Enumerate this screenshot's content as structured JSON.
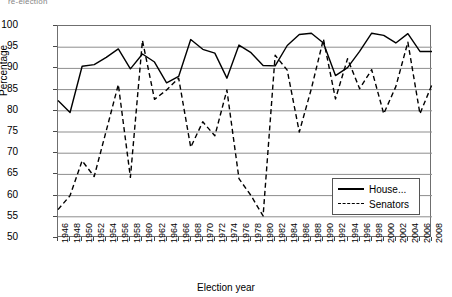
{
  "caption_fragment": "re-election",
  "axis": {
    "ylabel": "Percentage",
    "xlabel": "Election year",
    "y_ticks": [
      100,
      95,
      90,
      85,
      80,
      75,
      70,
      65,
      60,
      55,
      50
    ]
  },
  "legend": {
    "position": "inside-bottom-right",
    "entries": [
      {
        "label": "House...",
        "style": "solid"
      },
      {
        "label": "Senators",
        "style": "dashed"
      }
    ]
  },
  "chart_data": {
    "type": "line",
    "title": "",
    "subtitle": "",
    "xlabel": "Election year",
    "ylabel": "Percentage",
    "xlim": [
      1946,
      2008
    ],
    "ylim": [
      50,
      100
    ],
    "grid": true,
    "legend_position": "inside-bottom-right",
    "annotations": [],
    "x": [
      1946,
      1948,
      1950,
      1952,
      1954,
      1956,
      1958,
      1960,
      1962,
      1964,
      1966,
      1968,
      1970,
      1972,
      1974,
      1976,
      1978,
      1980,
      1982,
      1984,
      1986,
      1988,
      1990,
      1992,
      1994,
      1996,
      1998,
      2000,
      2002,
      2004,
      2006,
      2008
    ],
    "tick_labels": [
      "1946",
      "1948",
      "1950",
      "1952",
      "1954",
      "1956",
      "1958",
      "1960",
      "1962",
      "1964",
      "1966",
      "1968",
      "1970",
      "1972",
      "1974",
      "1976",
      "1978",
      "1980",
      "1982",
      "1984",
      "1986",
      "1988",
      "1990",
      "1992",
      "1994",
      "1996",
      "1998",
      "2000",
      "2002",
      "2004",
      "2006",
      "2008"
    ],
    "series": [
      {
        "name": "House...",
        "style": "solid",
        "color": "#000000",
        "values": [
          82.4,
          79.6,
          90.5,
          90.9,
          92.6,
          94.6,
          89.9,
          93.4,
          91.5,
          86.6,
          88.1,
          96.8,
          94.5,
          93.6,
          87.7,
          95.5,
          93.7,
          90.7,
          90.6,
          95.4,
          98.0,
          98.3,
          96.0,
          88.3,
          90.2,
          94.0,
          98.3,
          97.8,
          96.0,
          98.2,
          94.0,
          94.0
        ]
      },
      {
        "name": "Senators",
        "style": "dashed",
        "color": "#000000",
        "values": [
          56.7,
          60.0,
          68.2,
          64.5,
          75.3,
          86.2,
          64.3,
          96.6,
          82.7,
          84.9,
          87.7,
          71.4,
          77.4,
          74.1,
          84.9,
          64.0,
          60.0,
          55.2,
          93.1,
          89.6,
          75.0,
          85.2,
          96.9,
          82.8,
          92.3,
          85.2,
          89.7,
          79.3,
          85.7,
          96.2,
          79.3,
          86.2
        ]
      }
    ]
  }
}
